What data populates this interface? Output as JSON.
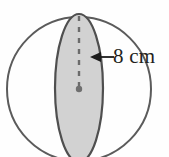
{
  "figure": {
    "kind": "geometry-diagram",
    "background_color": "#fefefe",
    "measurement": {
      "label": "8 cm",
      "value": 8,
      "unit": "cm",
      "measures": "radius",
      "text_color": "#231f20"
    },
    "sphere": {
      "name": "sphere-outline",
      "outline_color": "#5b5b5b",
      "outline_width": 2,
      "fill": "none",
      "center": {
        "x": 79,
        "y": 89
      },
      "radius": 72
    },
    "cross_section": {
      "name": "shaded-ellipse",
      "fill_color": "#d2d2d2",
      "outline_color": "#4f4f4f",
      "outline_width": 2.2,
      "center": {
        "x": 79,
        "y": 88
      },
      "radius_x": 24,
      "radius_y": 74
    },
    "radius_line": {
      "name": "dashed-radius",
      "color": "#6b6b6b",
      "width": 2.4,
      "dash_pattern": "5 6",
      "from": {
        "x": 79,
        "y": 16
      },
      "to": {
        "x": 79,
        "y": 89
      }
    },
    "center_dot": {
      "name": "center-point",
      "color": "#6f6f6f",
      "radius": 3.2,
      "at": {
        "x": 79,
        "y": 89
      }
    },
    "leader_arrow": {
      "name": "dimension-arrow",
      "color": "#1c1c1c",
      "width": 1.8,
      "direction": "left",
      "tip": {
        "x": 90,
        "y": 57
      },
      "tail": {
        "x": 114,
        "y": 57
      },
      "head_length": 11,
      "head_half_width": 5
    }
  }
}
